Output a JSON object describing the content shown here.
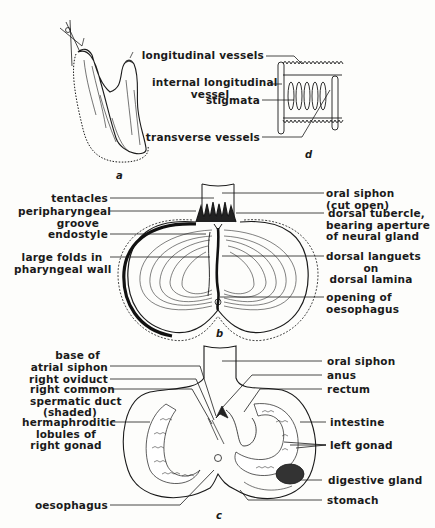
{
  "figure": {
    "panels": {
      "a": {
        "letter": "a"
      },
      "d": {
        "letter": "d",
        "labels": {
          "longitudinal_vessels": "longitudinal vessels",
          "internal_longitudinal_vessel_1": "internal longitudinal",
          "internal_longitudinal_vessel_2": "vessel",
          "stigmata": "stigmata",
          "transverse_vessels": "transverse vessels"
        }
      },
      "b": {
        "letter": "b",
        "labels": {
          "tentacles": "tentacles",
          "peripharyngeal_1": "peripharyngeal",
          "peripharyngeal_2": "groove",
          "endostyle": "endostyle",
          "large_folds_1": "large folds in",
          "large_folds_2": "pharyngeal wall",
          "oral_siphon_1": "oral siphon",
          "oral_siphon_2": "(cut open)",
          "dorsal_tubercle_1": "dorsal tubercle,",
          "dorsal_tubercle_2": "bearing aperture",
          "dorsal_tubercle_3": "of neural gland",
          "dorsal_languets_1": "dorsal languets",
          "dorsal_languets_2": "on",
          "dorsal_languets_3": "dorsal lamina",
          "opening_1": "opening of",
          "opening_2": "oesophagus"
        }
      },
      "c": {
        "letter": "c",
        "labels": {
          "base_atrial_1": "base of",
          "base_atrial_2": "atrial siphon",
          "right_oviduct": "right oviduct",
          "right_common_1": "right common",
          "right_common_2": "spermatic duct",
          "right_common_3": "(shaded)",
          "herm_1": "hermaphroditic",
          "herm_2": "lobules of",
          "herm_3": "right gonad",
          "oesophagus": "oesophagus",
          "oral_siphon": "oral siphon",
          "anus": "anus",
          "rectum": "rectum",
          "intestine": "intestine",
          "left_gonad": "left gonad",
          "digestive_gland": "digestive gland",
          "stomach": "stomach"
        }
      }
    }
  }
}
